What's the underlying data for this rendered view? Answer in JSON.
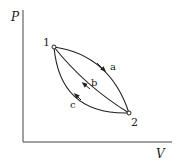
{
  "diagram": {
    "type": "PV cycle diagram",
    "axes": {
      "y_label": "P",
      "x_label": "V"
    },
    "points": [
      {
        "id": "1",
        "label": "1"
      },
      {
        "id": "2",
        "label": "2"
      }
    ],
    "paths": [
      {
        "id": "a",
        "label": "a",
        "from": "1",
        "to": "2",
        "shape": "upper curve"
      },
      {
        "id": "b",
        "label": "b",
        "from": "2",
        "to": "1",
        "shape": "nearly straight line"
      },
      {
        "id": "c",
        "label": "c",
        "from": "2",
        "to": "1",
        "shape": "lower curve"
      }
    ],
    "colors": {
      "line": "#222222",
      "background": "#ffffff"
    }
  }
}
